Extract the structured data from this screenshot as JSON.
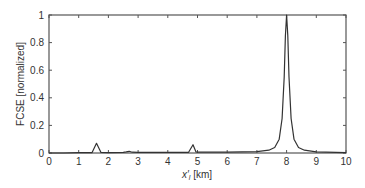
{
  "chart_data": {
    "type": "line",
    "title": "",
    "xlabel": "x′l [km]",
    "xlabel_main": "x′",
    "xlabel_sub": "l",
    "xlabel_unit": " [km]",
    "ylabel": "FCSE [normalized]",
    "xlim": [
      0,
      10
    ],
    "ylim": [
      0,
      1
    ],
    "xticks": [
      0,
      1,
      2,
      3,
      4,
      5,
      6,
      7,
      8,
      9,
      10
    ],
    "yticks": [
      0,
      0.2,
      0.4,
      0.6,
      0.8,
      1
    ],
    "ytick_labels": [
      "0",
      "0.2",
      "0.4",
      "0.6",
      "0.8",
      "1"
    ],
    "grid": false,
    "legend": null,
    "series": [
      {
        "name": "FCSE",
        "color": "#333333",
        "x": [
          0,
          0.5,
          1.0,
          1.45,
          1.6,
          1.75,
          2.0,
          2.5,
          2.6,
          2.7,
          2.8,
          3.0,
          4.0,
          4.7,
          4.85,
          4.95,
          5.0,
          6.0,
          7.0,
          7.4,
          7.6,
          7.75,
          7.85,
          7.92,
          7.96,
          8.0,
          8.04,
          8.08,
          8.15,
          8.25,
          8.4,
          8.6,
          9.0,
          10.0
        ],
        "y": [
          0,
          0,
          0.002,
          0.003,
          0.07,
          0.004,
          0.003,
          0.004,
          0.008,
          0.012,
          0.006,
          0.004,
          0.004,
          0.005,
          0.06,
          0.008,
          0.006,
          0.006,
          0.01,
          0.02,
          0.04,
          0.1,
          0.25,
          0.55,
          0.85,
          1.0,
          0.85,
          0.55,
          0.25,
          0.1,
          0.04,
          0.02,
          0.008,
          0.003
        ]
      }
    ]
  }
}
